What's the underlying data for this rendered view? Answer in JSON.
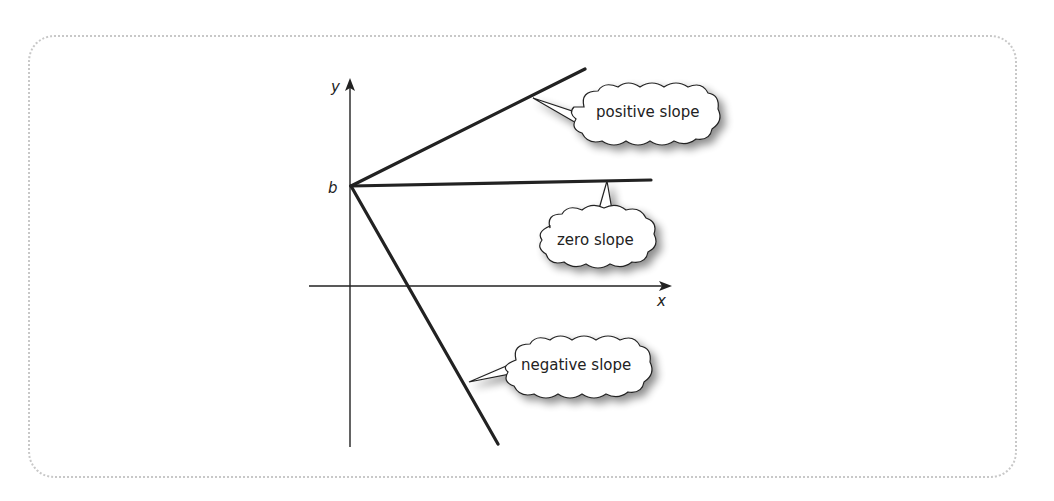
{
  "diagram": {
    "axes": {
      "x_label": "x",
      "y_label": "y",
      "intercept_label": "b"
    },
    "lines": [
      {
        "name": "positive",
        "label": "positive slope",
        "color": "#222222"
      },
      {
        "name": "zero",
        "label": "zero slope",
        "color": "#222222"
      },
      {
        "name": "negative",
        "label": "negative slope",
        "color": "#222222"
      }
    ],
    "colors": {
      "frame_border": "#c8c8c8",
      "stroke": "#222222",
      "background": "#ffffff"
    }
  }
}
